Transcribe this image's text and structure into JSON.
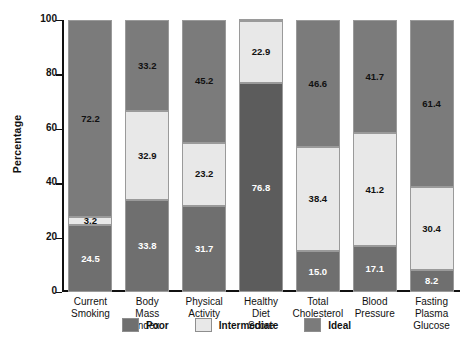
{
  "chart_data": {
    "type": "bar",
    "subtype": "stacked-bar-100-percent",
    "title": "",
    "xlabel": "",
    "ylabel": "Percentage",
    "ylim": [
      0,
      100
    ],
    "yticks": [
      0,
      20,
      40,
      60,
      80,
      100
    ],
    "ytick_labels": [
      "0",
      "20",
      "40",
      "60",
      "80",
      "100"
    ],
    "grid": false,
    "legend_position": "bottom-center",
    "categories": [
      "Current Smoking",
      "Body Mass Index",
      "Physical Activity",
      "Healthy Diet Score",
      "Total Cholesterol",
      "Blood Pressure",
      "Fasting Plasma Glucose"
    ],
    "category_lines": [
      [
        "Current",
        "Smoking"
      ],
      [
        "Body",
        "Mass",
        "Index"
      ],
      [
        "Physical",
        "Activity"
      ],
      [
        "Healthy",
        "Diet",
        "Score"
      ],
      [
        "Total",
        "Cholesterol"
      ],
      [
        "Blood",
        "Pressure"
      ],
      [
        "Fasting",
        "Plasma",
        "Glucose"
      ]
    ],
    "series": [
      {
        "name": "Poor",
        "color": "#6f6f6f",
        "values": [
          24.5,
          33.8,
          31.7,
          76.8,
          15.0,
          17.1,
          8.2
        ],
        "labels": [
          "24.5",
          "33.8",
          "31.7",
          "76.8",
          "15.0",
          "17.1",
          "8.2"
        ]
      },
      {
        "name": "Intermediate",
        "color": "#e8e8e8",
        "values": [
          3.2,
          32.9,
          23.2,
          22.9,
          38.4,
          41.2,
          30.4
        ],
        "labels": [
          "3.2",
          "32.9",
          "23.2",
          "22.9",
          "38.4",
          "41.2",
          "30.4"
        ]
      },
      {
        "name": "Ideal",
        "color": "#7b7b7b",
        "values": [
          72.2,
          33.2,
          45.2,
          0.3,
          46.6,
          41.7,
          61.4
        ],
        "labels": [
          "72.2",
          "33.2",
          "45.2",
          "",
          "46.6",
          "41.7",
          "61.4"
        ]
      }
    ]
  },
  "legend": {
    "items": [
      {
        "label": "Poor",
        "color": "#6f6f6f"
      },
      {
        "label": "Intermediate",
        "color": "#e8e8e8"
      },
      {
        "label": "Ideal",
        "color": "#7b7b7b"
      }
    ]
  },
  "axis": {
    "y_title": "Percentage"
  }
}
